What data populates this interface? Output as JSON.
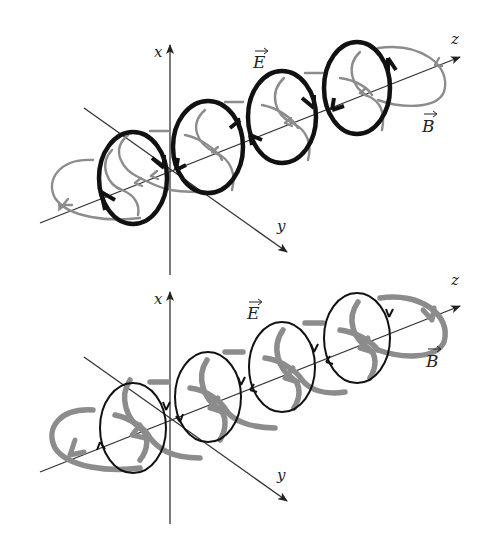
{
  "figure": {
    "panels": [
      {
        "id": "top",
        "axes": {
          "x": "x",
          "y": "y",
          "z": "z"
        },
        "field_labels": {
          "E": "E",
          "B": "B"
        },
        "E_style": "thick black",
        "B_style": "thin gray"
      },
      {
        "id": "bottom",
        "axes": {
          "x": "x",
          "y": "y",
          "z": "z"
        },
        "field_labels": {
          "E": "E",
          "B": "B"
        },
        "E_style": "thin black",
        "B_style": "thick gray"
      }
    ]
  },
  "colors": {
    "E_field": "#111111",
    "B_field": "#8c8c8c",
    "axis": "#333333",
    "background": "#ffffff"
  }
}
